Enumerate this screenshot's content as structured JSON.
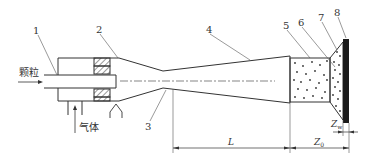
{
  "diagram": {
    "type": "cold-spray-nozzle-schematic",
    "inputs": {
      "particles_label": "颗粒",
      "gas_label": "气体"
    },
    "part_numbers": [
      "1",
      "2",
      "3",
      "4",
      "5",
      "6",
      "7",
      "8"
    ],
    "dimensions": {
      "L": "L",
      "Z0_main": "Z",
      "Z0_sub": "0",
      "Zw_main": "Z",
      "Zw_sub": "w"
    },
    "colors": {
      "line": "#333333",
      "substrate": "#1a1a1a",
      "background": "#ffffff"
    }
  }
}
